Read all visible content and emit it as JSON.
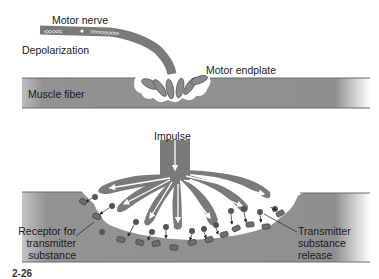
{
  "diagram": {
    "top_panel": {
      "labels": {
        "motor_nerve": "Motor nerve",
        "depolarization": "Depolarization",
        "motor_endplate": "Motor endplate",
        "muscle_fiber": "Muscle fiber"
      },
      "nerve_arrows_left": "<<<<<",
      "nerve_arrows_right": ">>>>>>>>"
    },
    "bottom_panel": {
      "labels": {
        "impulse": "Impulse",
        "receptor": [
          "Receptor for",
          "transmitter",
          "substance"
        ],
        "transmitter_release": [
          "Transmitter",
          "substance",
          "release"
        ]
      }
    },
    "caption_partial": "2-26",
    "colors": {
      "muscle_fiber": "#8f8f8f",
      "nerve": "#7a7a7a",
      "vesicle": "#555555",
      "receptor": "#6e6e6e",
      "background": "#ffffff"
    }
  }
}
